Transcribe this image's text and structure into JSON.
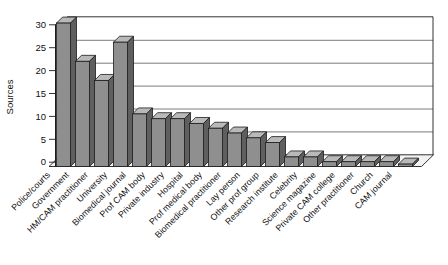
{
  "figure": {
    "background": "#ffffff"
  },
  "chart_data": {
    "type": "bar",
    "style": "3d-column",
    "title": "",
    "xlabel": "",
    "ylabel": "Sources",
    "ylim": [
      0,
      30
    ],
    "ytick_step": 5,
    "yticks": [
      "0",
      "5",
      "10",
      "15",
      "20",
      "25",
      "30"
    ],
    "grid": true,
    "legend": "none",
    "categories": [
      "Police/courts",
      "Government",
      "HM/CAM practitioner",
      "University",
      "Biomedical journal",
      "Prof CAM body",
      "Private industry",
      "Hospital",
      "Prof medical body",
      "Biomedical practitioner",
      "Lay person",
      "Other prof group",
      "Research institute",
      "Celebrity",
      "Science magazine",
      "Private CAM college",
      "Other practitioner",
      "Church",
      "CAM journal"
    ],
    "values": [
      30,
      22,
      18,
      26,
      11,
      10,
      10,
      9,
      8,
      7,
      6,
      5,
      2,
      2,
      1,
      1,
      1,
      1,
      0.5
    ],
    "colors": {
      "bar_front": "#8f8f8f",
      "bar_top": "#b9b9b9",
      "bar_side": "#5f5f5f",
      "bar_outline": "#1c1c1c",
      "gridline": "#5a5a5a",
      "axis": "#1c1c1c",
      "floor_fill": "#f2f2f2",
      "text": "#111111",
      "background": "#ffffff"
    }
  }
}
